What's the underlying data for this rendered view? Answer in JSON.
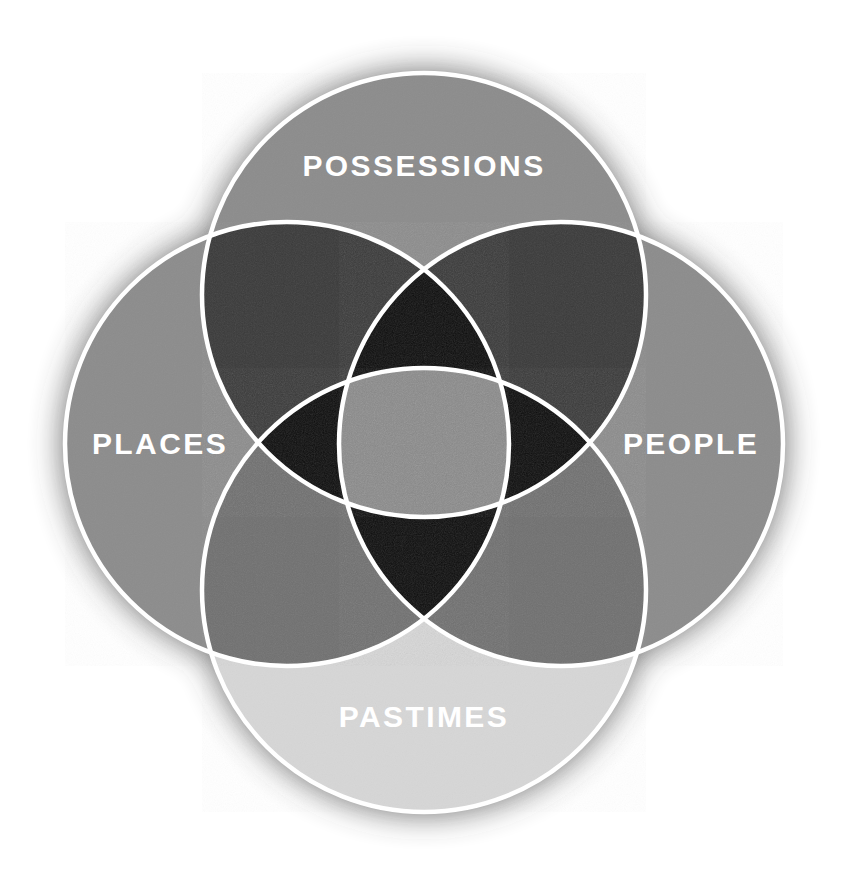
{
  "diagram": {
    "type": "venn",
    "set_count": 4,
    "title": "",
    "background_color": "#ffffff",
    "stroke_color": "#ffffff",
    "stroke_width": 4.5,
    "shadow_color": "#3d3d3d",
    "label_color": "#ffffff",
    "label_font_size": 30,
    "label_letter_spacing": 2.4,
    "canvas": {
      "width": 845,
      "height": 884
    },
    "sets": [
      {
        "id": "possessions",
        "label": "POSSESSIONS",
        "position": "top",
        "cx": 424,
        "cy": 295,
        "r": 222,
        "fill_color": "#8c8c8c",
        "label_x": 424,
        "label_y": 168
      },
      {
        "id": "places",
        "label": "PLACES",
        "position": "left",
        "cx": 287,
        "cy": 444,
        "r": 222,
        "fill_color": "#8c8c8c",
        "label_x": 160,
        "label_y": 446
      },
      {
        "id": "people",
        "label": "PEOPLE",
        "position": "right",
        "cx": 561,
        "cy": 444,
        "r": 222,
        "fill_color": "#8c8c8c",
        "label_x": 691,
        "label_y": 446
      },
      {
        "id": "pastimes",
        "label": "PASTIMES",
        "position": "bottom",
        "cx": 424,
        "cy": 590,
        "r": 222,
        "fill_color": "#d6d6d6",
        "label_x": 424,
        "label_y": 719
      }
    ],
    "region_colors": {
      "single": "#8c8c8c",
      "single_light": "#d6d6d6",
      "double_dark": "#3a3a3a",
      "double_mid": "#707070",
      "double_upper": "#3c3c3c",
      "triple": "#0d0d0d",
      "quadruple": "#8a8a8a"
    },
    "regions": [
      {
        "id": "possessions-only",
        "members": [
          "possessions"
        ],
        "color": "#8c8c8c"
      },
      {
        "id": "places-only",
        "members": [
          "places"
        ],
        "color": "#8c8c8c"
      },
      {
        "id": "people-only",
        "members": [
          "people"
        ],
        "color": "#8c8c8c"
      },
      {
        "id": "pastimes-only",
        "members": [
          "pastimes"
        ],
        "color": "#d6d6d6"
      },
      {
        "id": "possessions-places",
        "members": [
          "possessions",
          "places"
        ],
        "color": "#3a3a3a"
      },
      {
        "id": "possessions-people",
        "members": [
          "possessions",
          "people"
        ],
        "color": "#3a3a3a"
      },
      {
        "id": "places-pastimes",
        "members": [
          "places",
          "pastimes"
        ],
        "color": "#707070"
      },
      {
        "id": "people-pastimes",
        "members": [
          "people",
          "pastimes"
        ],
        "color": "#707070"
      },
      {
        "id": "possessions-places-people",
        "members": [
          "possessions",
          "places",
          "people"
        ],
        "color": "#0d0d0d"
      },
      {
        "id": "possessions-places-pastimes",
        "members": [
          "possessions",
          "places",
          "pastimes"
        ],
        "color": "#0d0d0d"
      },
      {
        "id": "possessions-people-pastimes",
        "members": [
          "possessions",
          "people",
          "pastimes"
        ],
        "color": "#0d0d0d"
      },
      {
        "id": "places-people-pastimes",
        "members": [
          "places",
          "people",
          "pastimes"
        ],
        "color": "#0d0d0d"
      },
      {
        "id": "all-four",
        "members": [
          "possessions",
          "places",
          "people",
          "pastimes"
        ],
        "color": "#8a8a8a"
      }
    ]
  }
}
